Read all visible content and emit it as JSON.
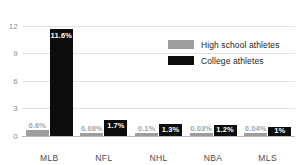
{
  "chart_data": {
    "type": "bar",
    "title": "",
    "subtitle": "",
    "xlabel": "",
    "ylabel": "",
    "ylim": [
      0,
      12.6
    ],
    "yticks": [
      "0",
      "3",
      "6",
      "9",
      "12"
    ],
    "ytick_values": [
      0,
      3,
      6,
      9,
      12
    ],
    "grid": true,
    "legend_position": "upper-right",
    "categories": [
      "MLB",
      "NFL",
      "NHL",
      "NBA",
      "MLS"
    ],
    "series": [
      {
        "name": "High school athletes",
        "color": "#9d9d9d",
        "values": [
          0.6,
          0.08,
          0.1,
          0.03,
          0.04
        ],
        "labels": [
          "0.6%",
          "0.08%",
          "0.1%",
          "0.03%",
          "0.04%"
        ]
      },
      {
        "name": "College athletes",
        "color": "#0d0d0d",
        "values": [
          11.6,
          1.7,
          1.3,
          1.2,
          1.0
        ],
        "labels": [
          "11.6%",
          "1.7%",
          "1.3%",
          "1.2%",
          "1%"
        ]
      }
    ]
  },
  "legend": {
    "items": [
      {
        "label": "High school athletes",
        "color": "#9d9d9d"
      },
      {
        "label": "College athletes",
        "color": "#0d0d0d"
      }
    ]
  },
  "colors": {
    "high_school": "#9d9d9d",
    "college": "#0d0d0d",
    "gridline": "#e2e2e2",
    "axis": "#b9b9b9",
    "tick_text": "#8a8a8a",
    "category_text": "#4a4a4a",
    "background": "#ffffff"
  }
}
